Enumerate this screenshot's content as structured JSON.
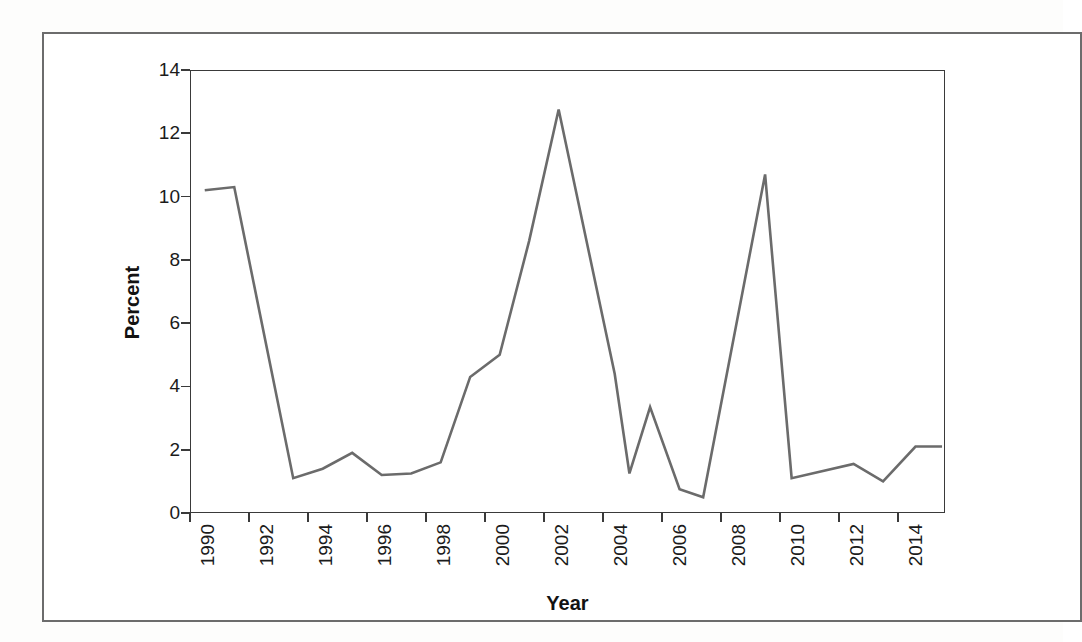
{
  "figure": {
    "y_axis_title": "Percent",
    "x_axis_title": "Year"
  },
  "chart_data": {
    "type": "line",
    "title": "",
    "xlabel": "Year",
    "ylabel": "Percent",
    "xlim": [
      1990,
      2015.6
    ],
    "ylim": [
      0,
      14
    ],
    "grid": false,
    "legend": "none",
    "x_tick_labels": [
      "1990",
      "1992",
      "1994",
      "1996",
      "1998",
      "2000",
      "2002",
      "2004",
      "2006",
      "2008",
      "2010",
      "2012",
      "2014"
    ],
    "x_tick_values": [
      1990,
      1992,
      1994,
      1996,
      1998,
      2000,
      2002,
      2004,
      2006,
      2008,
      2010,
      2012,
      2014
    ],
    "y_tick_labels": [
      "0",
      "2",
      "4",
      "6",
      "8",
      "10",
      "12",
      "14"
    ],
    "y_tick_values": [
      0,
      2,
      4,
      6,
      8,
      10,
      12,
      14
    ],
    "series": [
      {
        "name": "Percent",
        "color": "#6b6b6b",
        "x": [
          1990.5,
          1991.5,
          1993.5,
          1994.5,
          1995.5,
          1996.5,
          1997.5,
          1998.5,
          1999.5,
          2000.5,
          2001.5,
          2002.5,
          2004.4,
          2004.9,
          2005.6,
          2006.6,
          2007.4,
          2009.5,
          2010.4,
          2012.5,
          2013.5,
          2014.6,
          2015.5
        ],
        "y": [
          10.2,
          10.3,
          1.1,
          1.4,
          1.9,
          1.2,
          1.25,
          1.6,
          4.3,
          5.0,
          8.6,
          12.75,
          4.4,
          1.25,
          3.35,
          0.75,
          0.5,
          10.7,
          1.1,
          1.55,
          1.0,
          2.1,
          2.1
        ]
      }
    ]
  }
}
